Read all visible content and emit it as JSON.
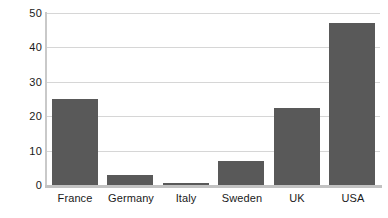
{
  "chart_data": {
    "type": "bar",
    "title": "",
    "subtitle": "",
    "xlabel": "",
    "ylabel": "",
    "categories": [
      "France",
      "Germany",
      "Italy",
      "Sweden",
      "UK",
      "USA"
    ],
    "values": [
      25,
      3,
      0.7,
      7,
      22.5,
      47
    ],
    "series": [
      {
        "name": "",
        "values": [
          25,
          3,
          0.7,
          7,
          22.5,
          47
        ]
      }
    ],
    "ylim": [
      0,
      50
    ],
    "y_ticks": [
      0,
      10,
      20,
      30,
      40,
      50
    ],
    "y_tick_labels": [
      "0",
      "10",
      "20",
      "30",
      "40",
      "50"
    ],
    "grid": true,
    "grid_axis": "y",
    "legend": false,
    "legend_position": "none",
    "bar_color": "#595959",
    "grid_color": "#d6d6d6",
    "axis_color": "#c2c2c2",
    "background_color": "#ffffff",
    "text_color": "#1a1a1a"
  }
}
